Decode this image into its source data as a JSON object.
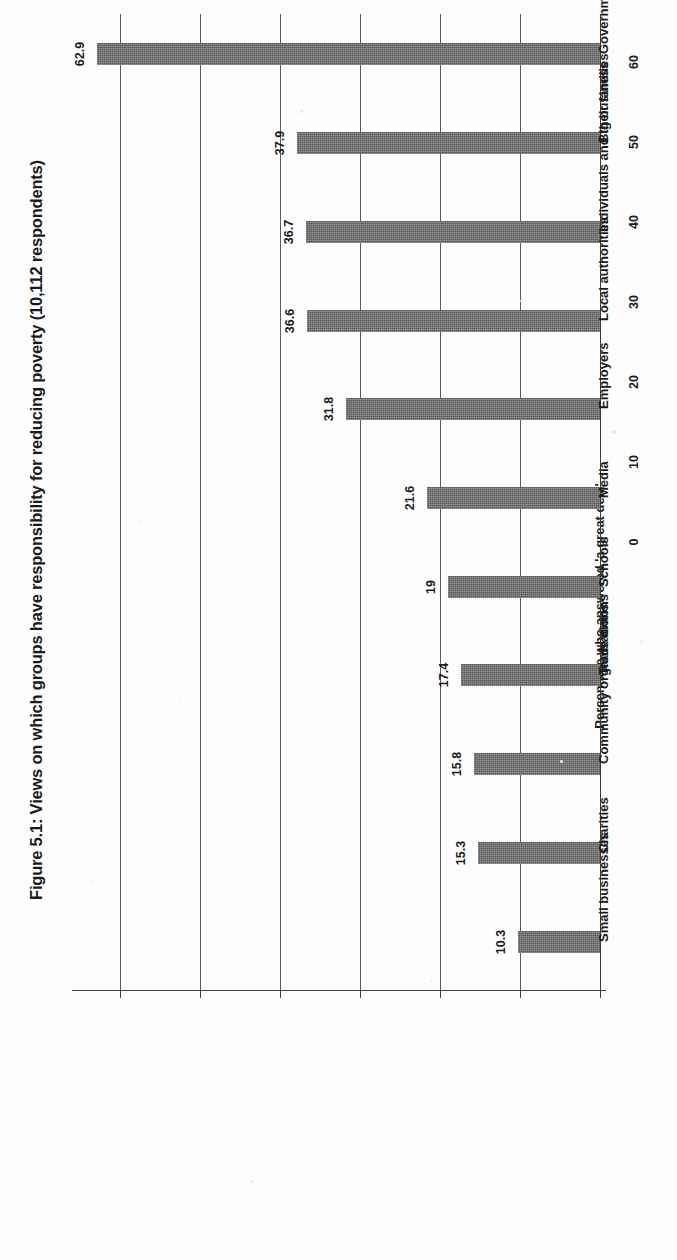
{
  "figure": {
    "title": "Figure 5.1: Views on which groups have responsibility for reducing poverty (10,112 respondents)"
  },
  "axis": {
    "value_axis_title": "Percentage who answered 'a great deal'",
    "tick_labels": [
      "0",
      "10",
      "20",
      "30",
      "40",
      "50",
      "60"
    ]
  },
  "chart_data": {
    "type": "bar",
    "title": "Figure 5.1: Views on which groups have responsibility for reducing poverty (10,112 respondents)",
    "orientation": "vertical-rotated-90",
    "categories": [
      "Government",
      "Big business",
      "Individuals and their families",
      "Local authorities",
      "Employers",
      "Media",
      "Schools",
      "Trade unions",
      "Community organisations",
      "Charities",
      "Small businesses"
    ],
    "values": [
      62.9,
      37.9,
      36.7,
      36.6,
      31.8,
      21.6,
      19,
      17.4,
      15.8,
      15.3,
      10.3
    ],
    "value_labels": [
      "62.9",
      "37.9",
      "36.7",
      "36.6",
      "31.8",
      "21.6",
      "19",
      "17.4",
      "15.8",
      "15.3",
      "10.3"
    ],
    "xlabel": "",
    "ylabel": "Percentage who answered 'a great deal'",
    "ylim": [
      0,
      66
    ],
    "yticks": [
      0,
      10,
      20,
      30,
      40,
      50,
      60
    ],
    "grid": true,
    "legend": false,
    "bar_color": "#6a6a6a",
    "respondents": "10,112"
  }
}
